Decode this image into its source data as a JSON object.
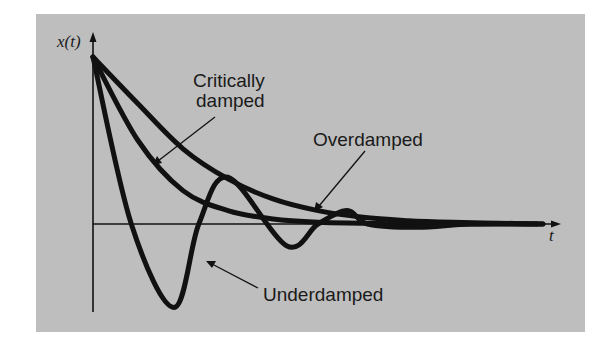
{
  "figure": {
    "background_color": "#bebebe",
    "curve_color": "#111111",
    "axis_color": "#111111"
  },
  "axes": {
    "y_label": "x(t)",
    "x_label": "t"
  },
  "annotations": {
    "critically_damped_line1": "Critically",
    "critically_damped_line2": "damped",
    "overdamped": "Overdamped",
    "underdamped": "Underdamped"
  },
  "chart_data": {
    "type": "line",
    "title": "",
    "xlabel": "t",
    "ylabel": "x(t)",
    "grid": false,
    "legend": "none (curves labeled with arrow annotations)",
    "axis_ticks": "none",
    "x_range": [
      0,
      10
    ],
    "y_range": [
      -0.55,
      1.05
    ],
    "series": [
      {
        "name": "Overdamped",
        "description": "Slow monotonic decay toward zero without crossing the t-axis",
        "t": [
          0,
          1,
          2,
          3,
          4,
          5,
          6,
          7,
          8,
          9,
          10
        ],
        "x": [
          1.0,
          0.72,
          0.45,
          0.27,
          0.15,
          0.08,
          0.04,
          0.02,
          0.01,
          0.005,
          0.0
        ]
      },
      {
        "name": "Critically damped",
        "description": "Fastest return to zero without oscillation",
        "t": [
          0,
          1,
          2,
          3,
          4,
          5,
          6,
          7,
          8,
          9,
          10
        ],
        "x": [
          1.0,
          0.5,
          0.2,
          0.08,
          0.03,
          0.01,
          0.005,
          0.0,
          0.0,
          0.0,
          0.0
        ]
      },
      {
        "name": "Underdamped",
        "description": "Oscillates about zero with decaying amplitude",
        "t": [
          0,
          0.85,
          1.8,
          2.35,
          3.0,
          4.3,
          5.0,
          5.65,
          6.1,
          7.2,
          8.4
        ],
        "x": [
          1.0,
          0.0,
          -0.5,
          0.0,
          0.28,
          -0.13,
          0.0,
          0.08,
          0.0,
          -0.02,
          0.0
        ]
      }
    ]
  }
}
